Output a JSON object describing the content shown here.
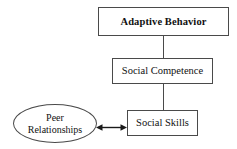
{
  "diagram": {
    "type": "flowchart",
    "orientation": "top-down",
    "background_color": "#ffffff",
    "line_color": "#4a4a4a",
    "text_color": "#111111",
    "nodes": [
      {
        "id": "adaptive-behavior",
        "label": "Adaptive Behavior",
        "shape": "rectangle",
        "emphasis": "bold"
      },
      {
        "id": "social-competence",
        "label": "Social Competence",
        "shape": "rectangle",
        "emphasis": "normal"
      },
      {
        "id": "social-skills",
        "label": "Social Skills",
        "shape": "rectangle",
        "emphasis": "normal"
      },
      {
        "id": "peer-relationships",
        "label_line1": "Peer",
        "label_line2": "Relationships",
        "shape": "ellipse",
        "emphasis": "normal"
      }
    ],
    "edges": [
      {
        "id": "ab-to-sc",
        "from": "adaptive-behavior",
        "to": "social-competence",
        "style": "plain-line",
        "direction": "none"
      },
      {
        "id": "sc-to-ss",
        "from": "social-competence",
        "to": "social-skills",
        "style": "plain-line",
        "direction": "none"
      },
      {
        "id": "peer-skills",
        "from": "peer-relationships",
        "to": "social-skills",
        "style": "arrow",
        "direction": "bidirectional"
      }
    ]
  }
}
